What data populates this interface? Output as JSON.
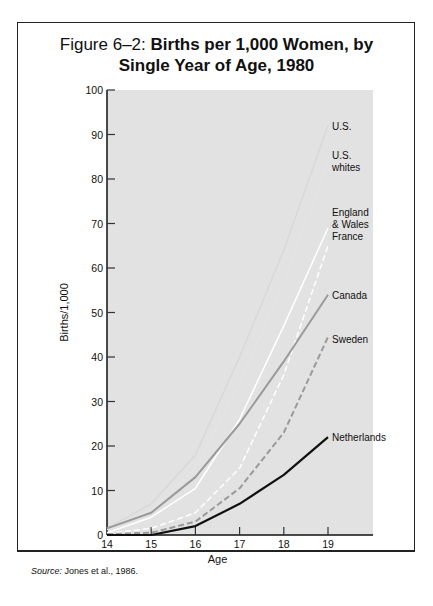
{
  "figure": {
    "title_lead": "Figure 6–2: ",
    "title_bold_line1": "Births per 1,000 Women, by",
    "title_bold_line2": "Single Year of Age, 1980",
    "source_label": "Source:",
    "source_text": " Jones et al., 1986."
  },
  "chart_data": {
    "type": "line",
    "title": "Figure 6–2: Births per 1,000 Women, by Single Year of Age, 1980",
    "xlabel": "Age",
    "ylabel": "Births/1,000",
    "x": [
      14,
      15,
      16,
      17,
      18,
      19
    ],
    "xlim": [
      14,
      19
    ],
    "ylim": [
      0,
      100
    ],
    "yticks": [
      0,
      10,
      20,
      30,
      40,
      50,
      60,
      70,
      80,
      90,
      100
    ],
    "xticks": [
      14,
      15,
      16,
      17,
      18,
      19
    ],
    "grid": false,
    "legend_position": "direct labels at right end of lines",
    "series": [
      {
        "name": "U.S.",
        "values": [
          1.5,
          7,
          18,
          40,
          64,
          92
        ],
        "color": "#d8d8d8",
        "style": "solid"
      },
      {
        "name": "U.S. whites",
        "values": [
          1.2,
          5.5,
          15,
          34,
          57,
          84
        ],
        "color": "#e4e4e4",
        "style": "solid"
      },
      {
        "name": "England & Wales",
        "values": [
          0.5,
          4,
          10.5,
          26,
          47,
          69
        ],
        "color": "#ffffff",
        "style": "solid"
      },
      {
        "name": "France",
        "values": [
          0.3,
          1.5,
          5,
          15,
          36,
          65
        ],
        "color": "#ffffff",
        "style": "dashed"
      },
      {
        "name": "Canada",
        "values": [
          1.5,
          5,
          13,
          25,
          39,
          54
        ],
        "color": "#9a9a9a",
        "style": "solid"
      },
      {
        "name": "Sweden",
        "values": [
          0.2,
          0.5,
          3,
          10.5,
          23,
          44.5
        ],
        "color": "#9a9a9a",
        "style": "dashed"
      },
      {
        "name": "Netherlands",
        "values": [
          0,
          0,
          2,
          7,
          13.5,
          22
        ],
        "color": "#111111",
        "style": "solid"
      }
    ],
    "labels": [
      {
        "text": [
          "U.S."
        ],
        "y_value": 92
      },
      {
        "text": [
          "U.S.",
          "whites"
        ],
        "y_value": 84
      },
      {
        "text": [
          "England",
          "& Wales",
          "France"
        ],
        "y_value": 70
      },
      {
        "text": [
          "Canada"
        ],
        "y_value": 54
      },
      {
        "text": [
          "Sweden"
        ],
        "y_value": 44
      },
      {
        "text": [
          "Netherlands"
        ],
        "y_value": 22
      }
    ]
  }
}
